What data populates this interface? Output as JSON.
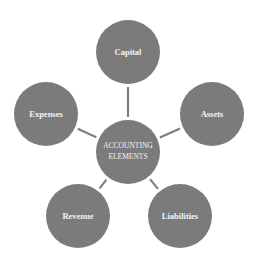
{
  "diagram": {
    "type": "hub-and-spoke",
    "colors": {
      "node_fill": "#7b7b7b",
      "connector": "#7f7f7f",
      "text": "#f4f4f4",
      "background": "#ffffff"
    },
    "center": {
      "lines": [
        "ACCOUNTING",
        "ELEMENTS"
      ]
    },
    "nodes": [
      {
        "id": "capital",
        "label": "Capital"
      },
      {
        "id": "assets",
        "label": "Assets"
      },
      {
        "id": "liabilities",
        "label": "Liabilities"
      },
      {
        "id": "revenue",
        "label": "Revenue"
      },
      {
        "id": "expenses",
        "label": "Expenses"
      }
    ]
  }
}
